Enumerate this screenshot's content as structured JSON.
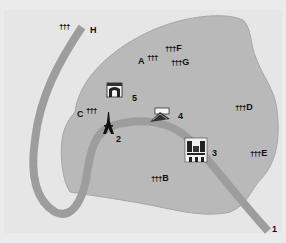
{
  "colors": {
    "page_bg": "#ebebeb",
    "land_bg": "#e6e6e6",
    "district_fill": "#b9b9b9",
    "district_stroke": "#a6a6a6",
    "river": "#9d9d9d",
    "text": "#111111"
  },
  "cemeteries": [
    {
      "label": "H",
      "icon": "cemetery-crosses-icon",
      "glyph": "†††"
    },
    {
      "label": "F",
      "icon": "cemetery-crosses-icon",
      "glyph": "†††"
    },
    {
      "label": "A",
      "icon": "cemetery-crosses-icon",
      "glyph": "†††"
    },
    {
      "label": "G",
      "icon": "cemetery-crosses-icon",
      "glyph": "†††"
    },
    {
      "label": "C",
      "icon": "cemetery-crosses-icon",
      "glyph": "†††"
    },
    {
      "label": "D",
      "icon": "cemetery-crosses-icon",
      "glyph": "†††"
    },
    {
      "label": "E",
      "icon": "cemetery-crosses-icon",
      "glyph": "†††"
    },
    {
      "label": "B",
      "icon": "cemetery-crosses-icon",
      "glyph": "†††"
    }
  ],
  "landmarks": [
    {
      "number": "1",
      "icon": "river-exit-marker"
    },
    {
      "number": "2",
      "icon": "eiffel-tower-icon"
    },
    {
      "number": "3",
      "icon": "notre-dame-cathedral-icon"
    },
    {
      "number": "4",
      "icon": "louvre-pyramid-icon"
    },
    {
      "number": "5",
      "icon": "arc-de-triomphe-icon"
    }
  ]
}
